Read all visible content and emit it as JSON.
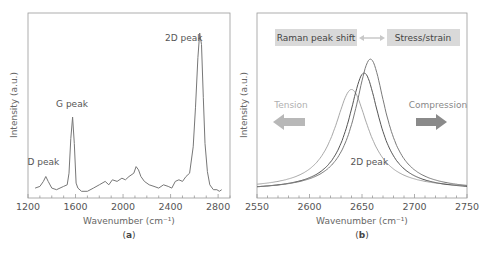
{
  "chart_data": [
    {
      "type": "line",
      "panel_label": "a",
      "title": "",
      "xlabel": "Wavenumber (cm⁻¹)",
      "ylabel": "Intensity (a.u.)",
      "xlim": [
        1200,
        2900
      ],
      "ylim": [
        0,
        1
      ],
      "xticks": [
        1200,
        1600,
        2000,
        2400,
        2800
      ],
      "tick_labels": [
        "1200",
        "1600",
        "2000",
        "2400",
        "2800"
      ],
      "grid": false,
      "series": [
        {
          "name": "Raman spectrum",
          "color": "#777777",
          "x": [
            1260,
            1300,
            1330,
            1350,
            1370,
            1400,
            1440,
            1500,
            1530,
            1545,
            1560,
            1575,
            1590,
            1605,
            1620,
            1650,
            1700,
            1750,
            1800,
            1850,
            1880,
            1910,
            1950,
            1990,
            2020,
            2050,
            2090,
            2110,
            2130,
            2150,
            2180,
            2220,
            2260,
            2300,
            2340,
            2380,
            2410,
            2440,
            2470,
            2500,
            2530,
            2560,
            2590,
            2610,
            2630,
            2645,
            2660,
            2675,
            2690,
            2710,
            2730,
            2760,
            2790,
            2810,
            2830
          ],
          "y": [
            0.03,
            0.04,
            0.07,
            0.1,
            0.07,
            0.03,
            0.02,
            0.04,
            0.05,
            0.12,
            0.33,
            0.46,
            0.3,
            0.06,
            0.03,
            0.01,
            0.01,
            0.03,
            0.05,
            0.07,
            0.05,
            0.08,
            0.07,
            0.09,
            0.08,
            0.1,
            0.12,
            0.16,
            0.14,
            0.1,
            0.07,
            0.05,
            0.04,
            0.03,
            0.05,
            0.04,
            0.03,
            0.07,
            0.08,
            0.07,
            0.1,
            0.12,
            0.28,
            0.52,
            0.82,
            0.97,
            0.9,
            0.58,
            0.3,
            0.13,
            0.05,
            0.02,
            0.02,
            0.01,
            0.02
          ]
        }
      ],
      "annotations": [
        {
          "text": "D peak",
          "x": 1330,
          "y": 0.17
        },
        {
          "text": "G peak",
          "x": 1570,
          "y": 0.52
        },
        {
          "text": "2D peak",
          "x": 2510,
          "y": 0.92
        }
      ]
    },
    {
      "type": "line",
      "panel_label": "b",
      "title": "",
      "xlabel": "Wavenumber (cm⁻¹)",
      "ylabel": "Intensity (a.u.)",
      "xlim": [
        2550,
        2750
      ],
      "ylim": [
        0,
        1
      ],
      "xticks": [
        2550,
        2600,
        2650,
        2700,
        2750
      ],
      "tick_labels": [
        "2550",
        "2600",
        "2650",
        "2700",
        "2750"
      ],
      "grid": false,
      "series": [
        {
          "name": "Tension (red-shifted)",
          "type": "lorentzian",
          "center": 2640,
          "hwhm": 20,
          "peak": 0.72,
          "baseline": 0.03,
          "color": "#a8a8a8"
        },
        {
          "name": "Unstrained",
          "type": "lorentzian",
          "center": 2652,
          "hwhm": 18,
          "peak": 0.85,
          "baseline": 0.02,
          "color": "#555555"
        },
        {
          "name": "Compression (blue-shifted)",
          "type": "lorentzian",
          "center": 2658,
          "hwhm": 18,
          "peak": 0.95,
          "baseline": 0.02,
          "color": "#7a7a7a"
        }
      ],
      "annotations": [
        {
          "text": "2D peak",
          "x": 2657,
          "y": 0.2
        }
      ],
      "legend_boxes": {
        "left": "Raman peak shift",
        "right": "Stress/strain"
      },
      "arrow_labels": {
        "tension": "Tension",
        "compression": "Compression"
      },
      "colors": {
        "tension": "#b0b0b0",
        "compression": "#8a8a8a",
        "box_fill": "#d9d9d9"
      }
    }
  ]
}
